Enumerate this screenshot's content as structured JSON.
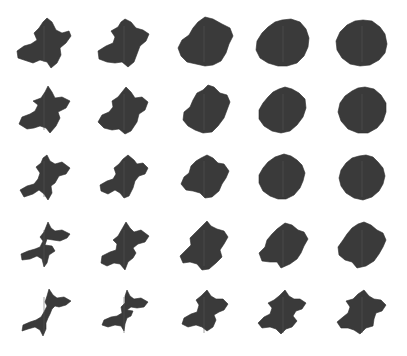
{
  "figure": {
    "background": "#ffffff",
    "fill_color": "#3a3a3a",
    "grid": {
      "rows": 5,
      "cols": 5
    },
    "cells": [
      [
        {
          "cx": 44,
          "cy": 44,
          "pts": "47,18 52,22 56,30 62,33 69,31 71,36 66,43 60,48 61,55 57,63 51,68 47,62 40,60 33,63 27,61 18,58 17,51 24,46 31,44 37,40 34,33 39,28 43,22"
        },
        {
          "cx": 124,
          "cy": 44,
          "pts": "125,19 131,22 136,28 143,30 149,34 146,41 140,46 137,54 134,62 128,67 122,62 115,63 107,62 99,59 98,51 106,46 113,43 115,37 111,31 118,27 121,22"
        },
        {
          "cx": 204,
          "cy": 44,
          "pts": "205,17 213,19 222,24 230,28 233,36 229,44 226,53 221,61 213,65 205,66 196,64 187,62 181,56 178,48 182,40 189,35 193,28 198,22"
        },
        {
          "cx": 283,
          "cy": 44,
          "pts": "282,20 291,19 300,22 306,29 309,38 308,47 304,56 297,63 287,66 278,66 268,63 260,58 256,50 257,41 262,33 268,27 275,22"
        },
        {
          "cx": 362,
          "cy": 44,
          "pts": "363,20 372,21 380,27 385,34 387,44 385,53 379,60 370,65 360,66 350,64 342,58 337,50 336,41 340,32 347,25 355,21"
        }
      ],
      [
        {
          "cx": 44,
          "cy": 112,
          "pts": "48,86 52,92 55,98 62,97 70,101 66,108 58,112 60,118 56,126 50,133 46,128 40,126 34,128 27,129 19,124 22,117 30,114 35,111 38,105 33,101 41,98 45,92"
        },
        {
          "cx": 124,
          "cy": 112,
          "pts": "126,87 131,92 135,98 142,97 148,102 145,110 139,114 137,122 131,131 125,134 119,129 112,130 104,128 98,122 102,115 109,112 113,107 112,101 118,97 122,92"
        },
        {
          "cx": 204,
          "cy": 112,
          "pts": "208,85 214,87 220,93 227,95 230,102 227,110 224,118 218,126 212,132 203,133 195,130 188,126 183,120 184,112 190,107 193,100 197,93 203,90"
        },
        {
          "cx": 283,
          "cy": 112,
          "pts": "285,87 292,89 299,93 305,99 306,108 303,117 297,125 290,131 281,133 272,131 264,126 259,119 259,110 263,103 268,97 273,92 279,89"
        },
        {
          "cx": 362,
          "cy": 112,
          "pts": "365,87 374,89 381,95 386,103 386,112 383,121 377,128 368,133 358,133 348,129 341,121 338,112 340,103 345,96 352,91 358,88"
        }
      ],
      [
        {
          "cx": 44,
          "cy": 179,
          "pts": "47,155 50,161 55,164 62,162 70,168 66,174 59,176 55,183 51,186 52,193 48,200 44,194 39,190 33,194 24,197 20,190 27,186 34,184 38,179 40,173 36,167 41,163 43,158"
        },
        {
          "cx": 124,
          "cy": 179,
          "pts": "128,155 134,160 137,164 143,163 148,168 145,174 139,176 135,181 133,188 129,196 124,198 120,193 115,190 108,194 101,191 100,185 107,181 113,179 116,174 114,168 119,164 123,159"
        },
        {
          "cx": 204,
          "cy": 179,
          "pts": "207,155 213,158 218,163 224,164 229,171 226,178 222,184 219,191 212,197 205,198 200,193 193,191 186,190 181,184 184,177 189,173 191,166 196,161 201,158"
        },
        {
          "cx": 283,
          "cy": 179,
          "pts": "284,154 291,156 297,160 302,165 305,173 303,181 300,188 294,195 286,199 278,199 270,196 263,191 259,183 259,175 263,168 268,162 275,157"
        },
        {
          "cx": 362,
          "cy": 179,
          "pts": "366,155 373,157 378,162 383,168 385,176 383,184 379,191 372,197 363,200 354,198 346,193 341,186 339,178 341,170 346,163 352,158 359,156"
        }
      ],
      [
        {
          "cx": 44,
          "cy": 248,
          "pts": "48,222 51,228 55,231 62,230 70,234 67,238 60,241 53,240 47,239 45,245 52,246 55,251 49,255 47,263 44,267 42,259 37,256 30,259 22,260 21,254 28,251 35,249 40,247 43,241 40,237 44,232 46,227"
        },
        {
          "cx": 124,
          "cy": 248,
          "pts": "126,222 130,228 134,232 141,230 149,236 145,242 138,244 133,248 136,253 133,258 128,262 125,270 120,264 114,263 107,266 101,263 102,256 110,252 116,250 117,244 113,240 118,236 122,229"
        },
        {
          "cx": 204,
          "cy": 248,
          "pts": "207,221 211,226 217,229 224,231 228,237 224,244 220,250 222,257 216,263 209,269 202,270 197,264 190,262 183,263 180,256 186,250 191,245 190,238 195,233 200,228"
        },
        {
          "cx": 283,
          "cy": 248,
          "pts": "285,223 292,225 298,230 304,232 308,239 304,246 301,253 297,259 290,264 281,268 277,262 270,262 262,261 259,253 265,247 267,240 272,234 277,229"
        },
        {
          "cx": 362,
          "cy": 248,
          "pts": "364,222 371,225 377,230 383,233 386,240 383,247 379,254 374,261 366,266 357,268 352,262 345,260 339,255 338,247 343,240 347,234 352,228 358,224"
        }
      ],
      [
        {
          "cx": 44,
          "cy": 315,
          "pts": "49,289 53,295 57,298 64,297 71,301 66,305 59,307 55,306 52,309 50,314 48,318 46,323 46,329 43,336 40,330 35,327 28,329 22,331 23,325 30,322 36,320 41,317 44,312 47,306 45,302 47,296"
        },
        {
          "cx": 124,
          "cy": 315,
          "pts": "127,290 130,296 134,299 141,298 148,302 144,307 137,308 131,307 127,310 133,311 131,316 127,318 125,324 124,331 121,326 115,325 108,327 102,325 104,320 111,317 117,316 122,313 121,307 125,303 125,296"
        },
        {
          "cx": 204,
          "cy": 315,
          "pts": "207,290 211,296 216,299 223,299 228,304 224,310 219,312 214,315 216,320 213,327 207,331 202,327 196,325 188,327 182,324 184,318 191,314 197,312 199,305 196,300 201,296 204,293"
        },
        {
          "cx": 283,
          "cy": 315,
          "pts": "285,290 289,296 294,299 300,299 306,303 302,309 296,311 293,316 297,321 292,327 286,329 281,334 276,329 270,327 262,328 258,323 264,317 270,314 272,308 268,303 274,300 279,296"
        },
        {
          "cx": 362,
          "cy": 315,
          "pts": "364,290 369,296 374,299 381,300 386,305 382,311 376,313 374,319 373,326 366,328 360,334 354,330 348,328 341,328 337,322 343,317 348,313 350,307 346,301 353,299 358,294"
        }
      ]
    ]
  }
}
